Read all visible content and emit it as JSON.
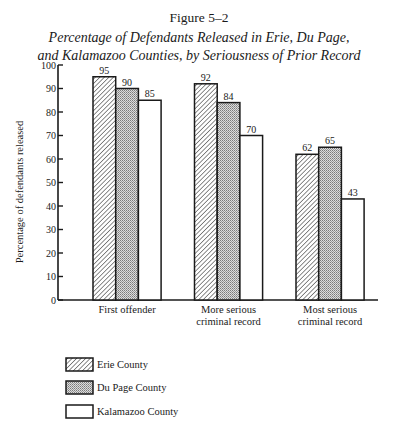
{
  "figure_number": "Figure 5–2",
  "title_line1": "Percentage of Defendants Released in Erie, Du Page,",
  "title_line2": "and Kalamazoo Counties, by Seriousness of Prior Record",
  "chart_data": {
    "type": "bar",
    "title": "Percentage of Defendants Released in Erie, Du Page, and Kalamazoo Counties, by Seriousness of Prior Record",
    "xlabel": "",
    "ylabel": "Percentage of defendants released",
    "ylim": [
      0,
      100
    ],
    "yticks": [
      0,
      10,
      20,
      30,
      40,
      50,
      60,
      70,
      80,
      90,
      100
    ],
    "grid": false,
    "legend_position": "bottom-left",
    "categories": [
      "First offender",
      "More serious criminal record",
      "Most serious criminal record"
    ],
    "category_label_lines": [
      [
        "First offender"
      ],
      [
        "More serious",
        "criminal record"
      ],
      [
        "Most serious",
        "criminal record"
      ]
    ],
    "series": [
      {
        "name": "Erie County",
        "pattern": "diagonal-hatch",
        "values": [
          95,
          92,
          62
        ]
      },
      {
        "name": "Du Page County",
        "pattern": "stipple",
        "values": [
          90,
          84,
          65
        ]
      },
      {
        "name": "Kalamazoo County",
        "pattern": "none",
        "values": [
          85,
          70,
          43
        ]
      }
    ],
    "data_labels": true
  },
  "colors": {
    "ink": "#1a1a1a",
    "stipple": "#b8b8b8",
    "background": "#ffffff"
  }
}
